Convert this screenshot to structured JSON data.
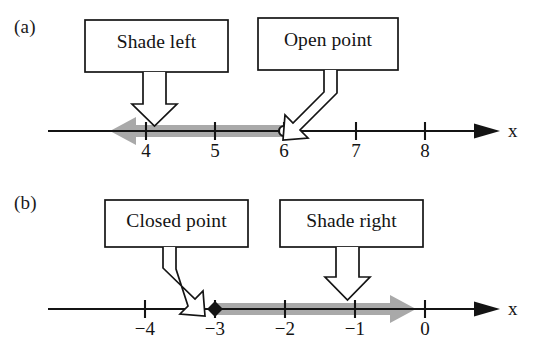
{
  "figure": {
    "type": "number-line-diagram",
    "background_color": "#ffffff",
    "ink_color": "#141414",
    "shade_color": "#a9a9a9"
  },
  "panels": [
    {
      "id": "a",
      "label": "(a)",
      "axis_name": "x",
      "tick_labels": [
        "4",
        "5",
        "6",
        "7",
        "8"
      ],
      "tick_values": [
        4,
        5,
        6,
        7,
        8
      ],
      "point": {
        "value": "6",
        "style": "open"
      },
      "shading": {
        "direction": "left",
        "from": "6"
      },
      "callouts": [
        {
          "text": "Shade left",
          "arrow": "straight-down",
          "points_to": "shade-bar"
        },
        {
          "text": "Open point",
          "arrow": "bent-down-left",
          "points_to": "open-point-at-6"
        }
      ]
    },
    {
      "id": "b",
      "label": "(b)",
      "axis_name": "x",
      "tick_labels": [
        "−4",
        "−3",
        "−2",
        "−1",
        "0"
      ],
      "tick_values": [
        -4,
        -3,
        -2,
        -1,
        0
      ],
      "point": {
        "value": "−3",
        "style": "closed"
      },
      "shading": {
        "direction": "right",
        "from": "−3"
      },
      "callouts": [
        {
          "text": "Closed point",
          "arrow": "bent-down-right",
          "points_to": "closed-point-at-minus-3"
        },
        {
          "text": "Shade right",
          "arrow": "straight-down",
          "points_to": "shade-bar"
        }
      ]
    }
  ]
}
